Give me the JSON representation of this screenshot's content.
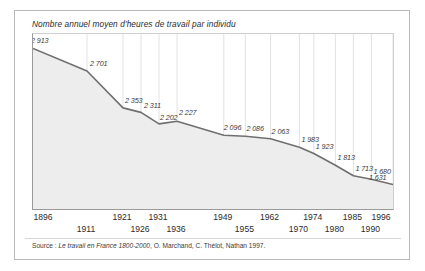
{
  "chart_data": {
    "type": "area",
    "title": "Nombre annuel moyen d'heures de travail par individu",
    "xlabel": "",
    "ylabel": "",
    "ylim": [
      1400,
      3050
    ],
    "grid": "vertical",
    "legend": "none",
    "categories": [
      "1896",
      "1911",
      "1921",
      "1926",
      "1931",
      "1936",
      "1949",
      "1955",
      "1962",
      "1970",
      "1974",
      "1980",
      "1985",
      "1990",
      "1996"
    ],
    "values": [
      2913,
      2701,
      2353,
      2311,
      2202,
      2227,
      2096,
      2086,
      2063,
      1983,
      1923,
      1813,
      1713,
      1680,
      1631
    ],
    "point_labels": [
      "2 913",
      "2 701",
      "2 353",
      "2 311",
      "2 202",
      "2 227",
      "2 096",
      "2 086",
      "2 063",
      "1 983",
      "1 923",
      "1 813",
      "1 713",
      "1 680",
      "1 631"
    ],
    "tick_rows": [
      0,
      1,
      0,
      1,
      0,
      1,
      0,
      1,
      0,
      1,
      0,
      1,
      0,
      1,
      0
    ],
    "source": {
      "prefix": "Source : ",
      "work_title": "Le travail en France 1800-2000",
      "suffix": ", O. Marchand, C. Thélot, Nathan 1997."
    },
    "colors": {
      "line": "#6f6f6f",
      "area": "#ededed",
      "grid": "#e2e2e2",
      "axis": "#9a9a9a",
      "text": "#2b2b2b",
      "frame": "#b9b9b9",
      "background": "#ffffff"
    }
  }
}
